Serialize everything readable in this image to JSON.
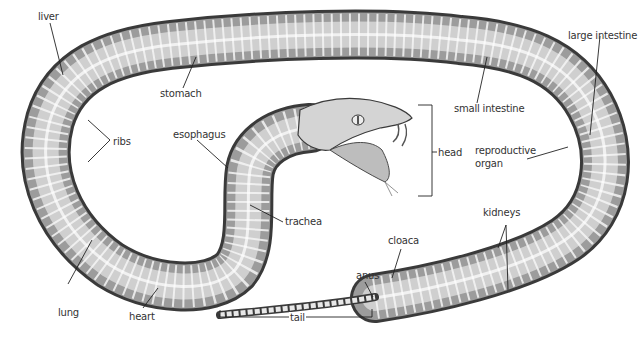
{
  "diagram": {
    "colors": {
      "background": "#ffffff",
      "label_text": "#333333",
      "leader_line": "#222222",
      "body_dark": "#4a4a4a",
      "body_mid": "#9a9a9a",
      "body_light": "#d8d8d8",
      "rib": "#f4f4f4"
    },
    "labels": {
      "liver": "liver",
      "stomach": "stomach",
      "ribs": "ribs",
      "esophagus": "esophagus",
      "trachea": "trachea",
      "lung": "lung",
      "heart": "heart",
      "head": "head",
      "small_intestine": "small intestine",
      "large_intestine": "large intestine",
      "reproductive_organ_line1": "reproductive",
      "reproductive_organ_line2": "organ",
      "kidneys": "kidneys",
      "cloaca": "cloaca",
      "anus": "anus",
      "tail": "tail"
    }
  }
}
